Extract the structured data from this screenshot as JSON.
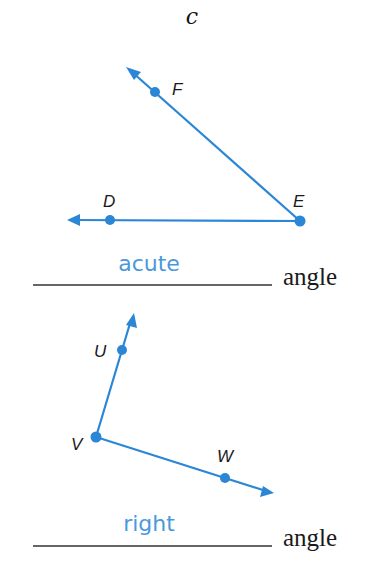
{
  "problem_label": "c",
  "colors": {
    "ray": "#2b86d6",
    "answer": "#4a98dc",
    "text": "#1a1a1a"
  },
  "diagrams": [
    {
      "points": [
        {
          "name": "F",
          "x": 155,
          "y": 92
        },
        {
          "name": "D",
          "x": 110,
          "y": 220
        },
        {
          "name": "E",
          "x": 300,
          "y": 221
        }
      ],
      "vertex": "E",
      "answer": "acute",
      "suffix": "angle"
    },
    {
      "points": [
        {
          "name": "U",
          "x": 122,
          "y": 350
        },
        {
          "name": "V",
          "x": 96,
          "y": 437
        },
        {
          "name": "W",
          "x": 225,
          "y": 478
        }
      ],
      "vertex": "V",
      "answer": "right",
      "suffix": "angle"
    }
  ]
}
